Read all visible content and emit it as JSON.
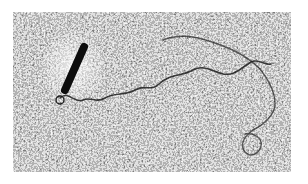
{
  "image": {
    "subject": "electron micrograph of a filamentous strand with a dark rod-shaped particle",
    "colors": {
      "background": "#ffffff",
      "field_dark": "#1e1e1e",
      "field_light": "#e6e6e6",
      "rod": "#0d0d0d",
      "strand": "#202020",
      "halo": "#f0f0f0"
    },
    "rod": {
      "x1": 71,
      "y1": 35,
      "x2": 52,
      "y2": 78,
      "width": 8
    },
    "strand_path": "M47 86 C55 78 62 92 70 88 C78 84 84 92 92 86 C102 80 112 84 122 78 C132 72 138 80 146 72 C156 62 170 64 180 58 C192 52 200 60 210 62 C222 64 228 56 238 50 C246 46 252 54 258 52",
    "strand_path_2": "M150 28 C170 20 190 26 210 34 C226 40 236 46 246 56 C256 68 262 80 262 92 C262 102 252 112 240 118 C232 124 226 132 232 140 C238 146 246 142 248 134 C250 126 240 120 232 122"
  }
}
